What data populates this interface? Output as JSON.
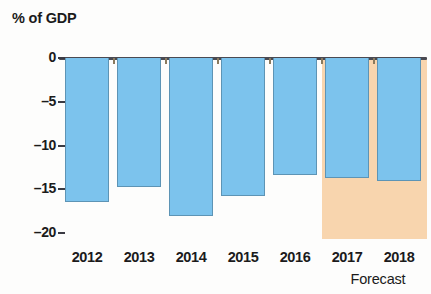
{
  "chart_data": {
    "type": "bar",
    "title": "% of GDP",
    "subtitle": "",
    "xlabel": "",
    "ylabel": "% of GDP",
    "categories": [
      "2012",
      "2013",
      "2014",
      "2015",
      "2016",
      "2017",
      "2018"
    ],
    "values": [
      -16.5,
      -14.7,
      -18.1,
      -15.8,
      -13.4,
      -13.7,
      -14.0
    ],
    "series": [
      {
        "name": "% of GDP",
        "values": [
          -16.5,
          -14.7,
          -18.1,
          -15.8,
          -13.4,
          -13.7,
          -14.0
        ]
      }
    ],
    "ylim": [
      -20,
      0
    ],
    "yticks": [
      0,
      -5,
      -10,
      -15,
      -20
    ],
    "ytick_labels": [
      "0",
      "–5",
      "–10",
      "–15",
      "–20"
    ],
    "grid": false,
    "legend": false,
    "annotations": [
      {
        "text": "Forecast",
        "applies_to": [
          "2017",
          "2018"
        ],
        "position": "below-axis-right",
        "shaded_region": true
      }
    ],
    "colors": {
      "bar_fill": "#7cc3ed",
      "bar_stroke": "#5d94b5",
      "forecast_band": "#f8d5ae",
      "axis": "#4a4a52",
      "text": "#1b1b1b",
      "background": "#fdfdfc"
    }
  },
  "axis": {
    "title": "% of GDP",
    "y_labels": [
      "0",
      "–5",
      "–10",
      "–15",
      "–20"
    ],
    "x_labels": [
      "2012",
      "2013",
      "2014",
      "2015",
      "2016",
      "2017",
      "2018"
    ]
  },
  "annotation": {
    "forecast_label": "Forecast"
  }
}
